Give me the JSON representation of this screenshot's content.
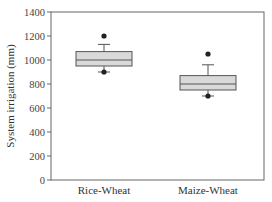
{
  "chart_data": {
    "type": "boxplot",
    "title": "",
    "xlabel": "",
    "ylabel": "System irrigation (mm)",
    "ylim": [
      0,
      1400
    ],
    "yticks": [
      0,
      200,
      400,
      600,
      800,
      1000,
      1200,
      1400
    ],
    "ytick_labels": [
      "0",
      "200",
      "400",
      "600",
      "800",
      "1000",
      "1200",
      "1400"
    ],
    "grid": false,
    "legend": null,
    "categories": [
      "Rice-Wheat",
      "Maize-Wheat"
    ],
    "series": [
      {
        "name": "Rice-Wheat",
        "whisker_low": 900,
        "q1": 950,
        "median": 1000,
        "q3": 1070,
        "whisker_high": 1130,
        "outliers": [
          900,
          1200
        ]
      },
      {
        "name": "Maize-Wheat",
        "whisker_low": 700,
        "q1": 750,
        "median": 800,
        "q3": 870,
        "whisker_high": 960,
        "outliers": [
          700,
          1050
        ]
      }
    ],
    "colors": {
      "box_fill": "#d9d9d9",
      "box_stroke": "#555555",
      "axis": "#666666",
      "outlier": "#222222"
    }
  }
}
